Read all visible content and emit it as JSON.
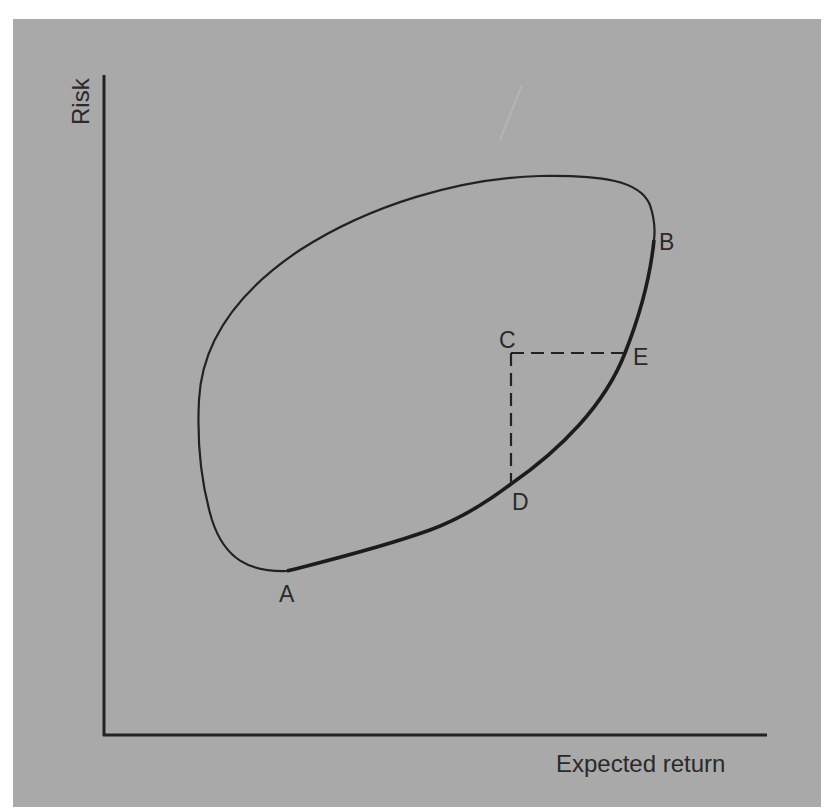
{
  "figure": {
    "background_color": "#a9a9a9",
    "line_color": "#222222",
    "axes": {
      "y_label": "Risk",
      "x_label": "Expected return"
    },
    "points": {
      "A": {
        "label": "A"
      },
      "B": {
        "label": "B"
      },
      "C": {
        "label": "C"
      },
      "D": {
        "label": "D"
      },
      "E": {
        "label": "E"
      }
    },
    "elements": [
      "closed feasible-set curve",
      "bold efficient frontier from A to B",
      "dashed line C to E (horizontal)",
      "dashed line C to D (vertical)"
    ]
  }
}
